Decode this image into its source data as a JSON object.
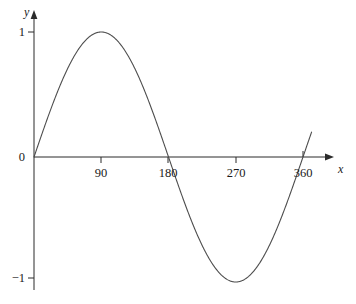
{
  "figure": {
    "background_color": "#ffffff",
    "curve_color": "#4d4d4d",
    "axis_color": "#2b2b2b",
    "text_color": "#1a1a1a"
  },
  "axes": {
    "x_axis_label": "x",
    "y_axis_label": "y",
    "x_ticks": [
      {
        "label": "90",
        "value": 90
      },
      {
        "label": "180",
        "value": 180
      },
      {
        "label": "270",
        "value": 270
      },
      {
        "label": "360",
        "value": 360
      }
    ],
    "y_ticks": [
      {
        "label": "1",
        "value": 1
      },
      {
        "label": "0",
        "value": 0
      },
      {
        "label": "−1",
        "value": -1
      }
    ]
  },
  "chart_data": {
    "type": "line",
    "title": "",
    "subtitle": "",
    "xlabel": "x",
    "ylabel": "y",
    "xlim": [
      0,
      375
    ],
    "ylim": [
      -1.32,
      1.32
    ],
    "grid": false,
    "legend": null,
    "annotations": [],
    "series": [
      {
        "name": "y = sin(x)",
        "color": "#4d4d4d",
        "x": [
          0,
          10,
          20,
          30,
          40,
          50,
          60,
          70,
          80,
          90,
          100,
          110,
          120,
          130,
          140,
          150,
          160,
          170,
          180,
          190,
          200,
          210,
          220,
          230,
          240,
          250,
          260,
          270,
          280,
          290,
          300,
          310,
          320,
          330,
          340,
          350,
          360,
          370
        ],
        "values": [
          0,
          0.174,
          0.342,
          0.5,
          0.643,
          0.766,
          0.866,
          0.94,
          0.985,
          1,
          0.985,
          0.94,
          0.866,
          0.766,
          0.643,
          0.5,
          0.342,
          0.174,
          0,
          -0.174,
          -0.342,
          -0.5,
          -0.643,
          -0.766,
          -0.866,
          -0.94,
          -0.985,
          -1,
          -0.985,
          -0.94,
          -0.866,
          -0.766,
          -0.643,
          -0.5,
          -0.342,
          -0.174,
          0,
          0.174
        ]
      }
    ],
    "x_tick_labels": [
      "90",
      "180",
      "270",
      "360"
    ],
    "x_tick_values": [
      90,
      180,
      270,
      360
    ],
    "y_tick_labels": [
      "1",
      "0",
      "−1"
    ],
    "y_tick_values": [
      1,
      0,
      -1
    ]
  }
}
